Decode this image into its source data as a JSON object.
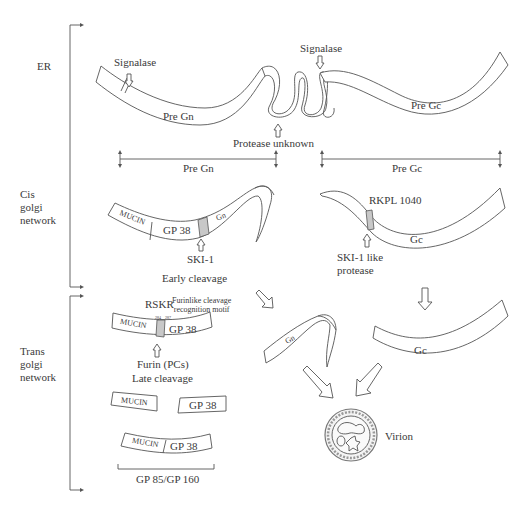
{
  "diagram": {
    "stages": [
      {
        "id": "er",
        "label_lines": [
          "ER"
        ]
      },
      {
        "id": "cis",
        "label_lines": [
          "Cis",
          "golgi",
          "network"
        ]
      },
      {
        "id": "trans",
        "label_lines": [
          "Trans",
          "golgi",
          "network"
        ]
      }
    ],
    "er": {
      "signalase_left": "Signalase",
      "signalase_right": "Signalase",
      "pre_gn": "Pre Gn",
      "pre_gc": "Pre Gc",
      "protease_unknown": "Protease unknown"
    },
    "spans": {
      "pre_gn": "Pre Gn",
      "pre_gc": "Pre Gc"
    },
    "cis": {
      "mucin": "MUCIN",
      "gp38": "GP 38",
      "gn": "Gn",
      "ski1": "SKI-1",
      "early_cleavage": "Early cleavage",
      "rkpl": "RKPL 1040",
      "gc": "Gc",
      "ski1_like_line1": "SKI-1 like",
      "ski1_like_line2": "protease"
    },
    "trans": {
      "rskr": "RSKR",
      "motif_line1": "Furinlike cleavage",
      "motif_line2": "recognition motif",
      "pos_left": "284",
      "pos_right": "287",
      "mucin": "MUCIN",
      "gp38": "GP 38",
      "furin": "Furin (PCs)",
      "late_cleavage": "Late cleavage",
      "frag_mucin": "MUCIN",
      "frag_gp38": "GP 38",
      "joined_mucin": "MUCIN",
      "joined_gp38": "GP 38",
      "gp85_160": "GP 85/GP 160"
    },
    "products": {
      "gn": "Gn",
      "gc": "Gc",
      "virion": "Virion"
    },
    "colors": {
      "stroke": "#555555",
      "cleavage_site_fill": "#c8c8c8",
      "text": "#3a3a3a"
    }
  }
}
